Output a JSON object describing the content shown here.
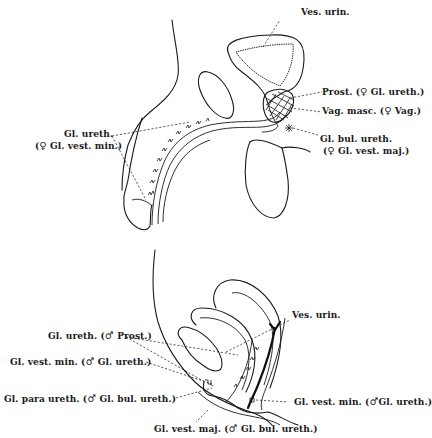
{
  "figure": {
    "type": "anatomical-diagram",
    "panels": [
      "male-sagittal-section",
      "female-sagittal-section"
    ]
  },
  "male": {
    "ves_urin": "Ves. urin.",
    "prost": {
      "name": "Prost.",
      "symbol": "♀",
      "homolog": "Gl. ureth."
    },
    "vag_masc": {
      "name": "Vag. masc.",
      "symbol": "♀",
      "homolog": "Vag."
    },
    "gl_bul_ureth": {
      "name": "Gl. bul. ureth.",
      "symbol": "♀",
      "homolog": "Gl. vest. maj."
    },
    "gl_ureth": {
      "name": "Gl. ureth.",
      "symbol": "♀",
      "homolog": "Gl. vest. min."
    }
  },
  "female": {
    "ves_urin": "Ves. urin.",
    "gl_ureth": {
      "name": "Gl. ureth.",
      "symbol": "♂",
      "homolog": "Prost."
    },
    "gl_vest_min_left": {
      "name": "Gl. vest. min.",
      "symbol": "♂",
      "homolog": "Gl. ureth."
    },
    "gl_para_ureth": {
      "name": "Gl. para ureth.",
      "symbol": "♂",
      "homolog": "Gl. bul. ureth."
    },
    "gl_vest_min_right": {
      "name": "Gl. vest. min.",
      "symbol": "♂",
      "homolog": "Gl. ureth."
    },
    "gl_vest_maj": {
      "name": "Gl. vest. maj.",
      "symbol": "♂",
      "homolog": "Gl. bul. ureth."
    }
  },
  "paren_open": "(",
  "paren_close": ")"
}
